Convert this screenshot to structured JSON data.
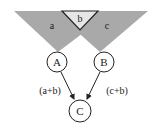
{
  "regions": [
    {
      "id": "a",
      "label": "a",
      "color": "#a9a9a9"
    },
    {
      "id": "b",
      "label": "b",
      "color": "#e6e6e6"
    },
    {
      "id": "c",
      "label": "c",
      "color": "#a9a9a9"
    }
  ],
  "nodes": [
    {
      "id": "A",
      "label": "A"
    },
    {
      "id": "B",
      "label": "B"
    },
    {
      "id": "C",
      "label": "C"
    }
  ],
  "edges": [
    {
      "from": "A",
      "to": "C",
      "label": "(a+b)"
    },
    {
      "from": "B",
      "to": "C",
      "label": "(c+b)"
    }
  ],
  "colors": {
    "stroke": "#222222",
    "shade": "#a9a9a9",
    "light": "#e6e6e6"
  }
}
